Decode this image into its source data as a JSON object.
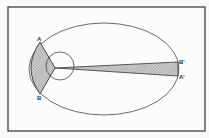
{
  "diagram": {
    "labels": {
      "A": "A",
      "B": "B",
      "A_prime": "A'",
      "B_prime": "B'"
    },
    "colors": {
      "background": "#fafafa",
      "stroke": "#333333",
      "hatch": "#777777"
    }
  }
}
